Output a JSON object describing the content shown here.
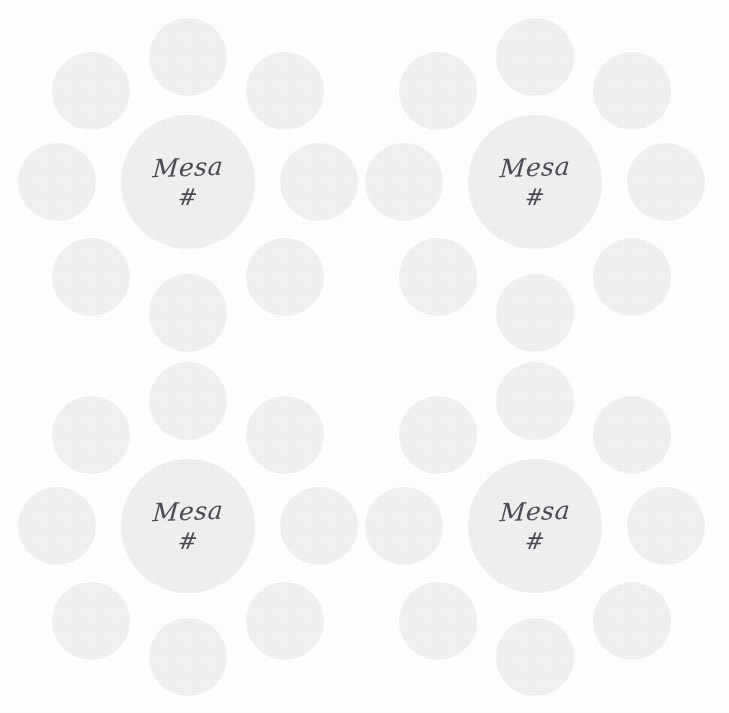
{
  "page": {
    "background_color": "#ffffff",
    "width": 729,
    "height": 713
  },
  "palette": {
    "dot_fill": "#f1f1f2",
    "center_dot_fill": "#f0f0f1",
    "text_color": "#4b4b53",
    "background": "#ffffff"
  },
  "motifs": [
    {
      "id": "top-left",
      "wordmark": "Mesa",
      "symbol": "#",
      "satellite_count": 8
    },
    {
      "id": "top-right",
      "wordmark": "Mesa",
      "symbol": "#",
      "satellite_count": 8
    },
    {
      "id": "bottom-left",
      "wordmark": "Mesa",
      "symbol": "#",
      "satellite_count": 8
    },
    {
      "id": "bottom-right",
      "wordmark": "Mesa",
      "symbol": "#",
      "satellite_count": 8
    }
  ]
}
